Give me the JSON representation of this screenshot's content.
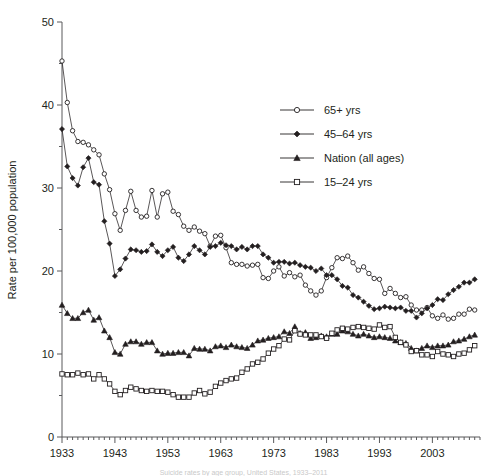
{
  "chart_data": {
    "type": "line",
    "title": "",
    "xlabel": "",
    "ylabel": "Rate per 100,000 population",
    "xlim": [
      1933,
      2012
    ],
    "ylim": [
      0,
      50
    ],
    "yticks": [
      0,
      10,
      20,
      30,
      40,
      50
    ],
    "yticklabels": [
      "0",
      "10",
      "20",
      "30",
      "40",
      "50"
    ],
    "xticks": [
      1933,
      1943,
      1953,
      1963,
      1973,
      1983,
      1993,
      2003
    ],
    "xticklabels": [
      "1933",
      "1943",
      "1953",
      "1963",
      "1973",
      "1983",
      "1993",
      "2003"
    ],
    "minor_xticks_every": 1,
    "minor_yticks_every": 5,
    "grid": false,
    "legend_position": "upper-center-right",
    "x": [
      1933,
      1934,
      1935,
      1936,
      1937,
      1938,
      1939,
      1940,
      1941,
      1942,
      1943,
      1944,
      1945,
      1946,
      1947,
      1948,
      1949,
      1950,
      1951,
      1952,
      1953,
      1954,
      1955,
      1956,
      1957,
      1958,
      1959,
      1960,
      1961,
      1962,
      1963,
      1964,
      1965,
      1966,
      1967,
      1968,
      1969,
      1970,
      1971,
      1972,
      1973,
      1974,
      1975,
      1976,
      1977,
      1978,
      1979,
      1980,
      1981,
      1982,
      1983,
      1984,
      1985,
      1986,
      1987,
      1988,
      1989,
      1990,
      1991,
      1992,
      1993,
      1994,
      1995,
      1996,
      1997,
      1998,
      1999,
      2000,
      2001,
      2002,
      2003,
      2004,
      2005,
      2006,
      2007,
      2008,
      2009,
      2010,
      2011
    ],
    "series": [
      {
        "name": "65+ yrs",
        "marker": "open-circle",
        "values": [
          45.3,
          40.3,
          36.9,
          35.6,
          35.5,
          35.2,
          34.6,
          34.0,
          31.7,
          29.8,
          26.9,
          24.9,
          27.3,
          29.6,
          27.3,
          26.5,
          26.6,
          29.7,
          26.5,
          29.3,
          29.5,
          27.2,
          26.8,
          25.4,
          24.9,
          25.3,
          24.8,
          24.5,
          23.0,
          24.2,
          24.3,
          22.8,
          21.0,
          20.8,
          20.8,
          20.6,
          20.7,
          20.8,
          19.2,
          19.1,
          20.0,
          20.5,
          19.4,
          19.8,
          19.3,
          19.5,
          18.3,
          17.6,
          17.1,
          17.6,
          19.2,
          20.4,
          21.6,
          21.5,
          21.8,
          21.0,
          20.1,
          20.5,
          19.7,
          19.1,
          19.0,
          17.3,
          17.9,
          17.3,
          16.8,
          16.9,
          15.9,
          15.3,
          15.3,
          15.6,
          14.6,
          14.3,
          14.7,
          14.2,
          14.3,
          14.8,
          14.8,
          15.4,
          15.3
        ]
      },
      {
        "name": "45–64 yrs",
        "marker": "filled-diamond",
        "values": [
          37.1,
          32.6,
          31.2,
          30.3,
          32.5,
          33.6,
          30.7,
          30.4,
          26.0,
          23.3,
          19.4,
          20.2,
          21.5,
          22.6,
          22.5,
          22.3,
          22.4,
          23.2,
          22.3,
          21.8,
          22.5,
          22.9,
          21.6,
          21.2,
          22.0,
          23.0,
          22.5,
          22.0,
          22.9,
          23.0,
          23.4,
          23.1,
          23.0,
          22.6,
          22.9,
          22.6,
          23.0,
          23.0,
          22.0,
          21.6,
          21.0,
          21.1,
          21.1,
          20.9,
          21.0,
          20.7,
          20.5,
          20.4,
          20.0,
          20.3,
          19.5,
          19.5,
          19.0,
          18.2,
          18.0,
          17.1,
          16.8,
          16.3,
          15.8,
          15.4,
          15.5,
          15.7,
          15.6,
          15.5,
          15.6,
          15.2,
          15.2,
          14.4,
          14.9,
          15.5,
          15.9,
          16.6,
          16.5,
          17.2,
          17.7,
          18.1,
          18.6,
          18.6,
          19.0
        ]
      },
      {
        "name": "Nation (all ages)",
        "marker": "filled-triangle",
        "values": [
          15.9,
          14.9,
          14.3,
          14.3,
          15.0,
          15.3,
          14.1,
          14.4,
          12.8,
          12.0,
          10.2,
          10.0,
          11.2,
          11.5,
          11.5,
          11.2,
          11.4,
          11.4,
          10.4,
          10.0,
          10.1,
          10.1,
          10.2,
          10.2,
          9.8,
          10.7,
          10.6,
          10.6,
          10.4,
          10.9,
          11.0,
          10.8,
          11.1,
          10.9,
          10.8,
          10.7,
          11.1,
          11.6,
          11.7,
          11.9,
          12.0,
          12.1,
          12.7,
          12.5,
          13.3,
          12.5,
          12.6,
          11.9,
          12.0,
          12.2,
          12.1,
          12.4,
          12.4,
          12.8,
          12.7,
          12.4,
          12.2,
          12.4,
          12.2,
          12.0,
          12.1,
          12.0,
          11.9,
          11.6,
          11.4,
          11.3,
          10.7,
          10.4,
          10.7,
          11.0,
          10.8,
          11.0,
          11.0,
          11.1,
          11.5,
          11.6,
          11.8,
          12.1,
          12.3
        ]
      },
      {
        "name": "15–24 yrs",
        "marker": "open-square",
        "values": [
          7.6,
          7.5,
          7.5,
          7.7,
          7.5,
          7.6,
          7.0,
          7.5,
          7.0,
          6.4,
          5.5,
          5.1,
          5.6,
          6.0,
          5.8,
          5.6,
          5.5,
          5.6,
          5.5,
          5.5,
          5.4,
          5.1,
          4.8,
          4.8,
          4.8,
          5.3,
          5.6,
          5.2,
          5.4,
          6.1,
          6.5,
          6.8,
          7.0,
          7.1,
          7.8,
          8.2,
          8.8,
          9.0,
          9.4,
          10.1,
          10.6,
          11.0,
          11.8,
          11.7,
          12.8,
          12.4,
          12.3,
          12.3,
          12.3,
          12.1,
          11.9,
          12.5,
          12.9,
          13.1,
          13.0,
          13.2,
          13.3,
          13.2,
          13.1,
          13.0,
          13.5,
          13.2,
          13.3,
          12.0,
          11.4,
          11.1,
          10.3,
          10.4,
          9.9,
          9.9,
          9.7,
          10.3,
          10.0,
          9.9,
          9.7,
          10.0,
          10.1,
          10.5,
          11.0
        ]
      }
    ]
  },
  "legend": {
    "items": [
      {
        "label": "65+ yrs",
        "marker": "open-circle"
      },
      {
        "label": "45–64 yrs",
        "marker": "filled-diamond"
      },
      {
        "label": "Nation (all ages)",
        "marker": "filled-triangle"
      },
      {
        "label": "15–24 yrs",
        "marker": "open-square"
      }
    ]
  },
  "axes": {
    "y_title": "Rate per 100,000 population"
  },
  "caption": {
    "text": "Suicide rates by age group, United States, 1933–2011"
  }
}
